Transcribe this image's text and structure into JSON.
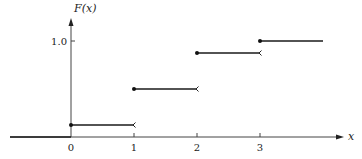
{
  "chart_data": {
    "type": "line",
    "subtype": "step",
    "title": "",
    "xlabel": "x",
    "ylabel": "F(x)",
    "x_ticks": [
      "0",
      "1",
      "2",
      "3"
    ],
    "y_ticks": [
      "1.0"
    ],
    "xlim": [
      -3.4,
      4.4
    ],
    "ylim": [
      0,
      1.0
    ],
    "grid": false,
    "legend": null,
    "steps": [
      {
        "x_start": -3.4,
        "x_end": 0,
        "y": 0.0,
        "closed_left": false,
        "open_right": false
      },
      {
        "x_start": 0,
        "x_end": 1,
        "y": 0.125,
        "closed_left": true,
        "open_right": true
      },
      {
        "x_start": 1,
        "x_end": 2,
        "y": 0.5,
        "closed_left": true,
        "open_right": true
      },
      {
        "x_start": 2,
        "x_end": 3,
        "y": 0.875,
        "closed_left": true,
        "open_right": true
      },
      {
        "x_start": 3,
        "x_end": 4,
        "y": 1.0,
        "closed_left": true,
        "open_right": false
      }
    ],
    "series": [
      {
        "name": "F(x)",
        "x": [
          0,
          1,
          2,
          3
        ],
        "values": [
          0.125,
          0.5,
          0.875,
          1.0
        ]
      }
    ]
  }
}
